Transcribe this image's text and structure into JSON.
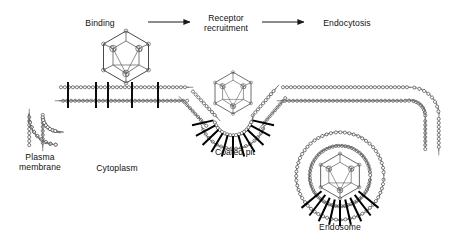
{
  "diagram": {
    "background": "#ffffff",
    "ink": "#1a1a1a",
    "line_color": "#555555",
    "receptor_color": "#000000"
  },
  "flow": {
    "steps": [
      {
        "id": "binding",
        "label": "Binding",
        "x": 100,
        "y": 18
      },
      {
        "id": "recruit",
        "label": "Receptor\nrecruitment",
        "x": 200,
        "y": 13
      },
      {
        "id": "endocyt",
        "label": "Endocytosis",
        "x": 313,
        "y": 18
      }
    ],
    "arrows": [
      {
        "id": "arrow-binding-to-recruitment",
        "x1": 148,
        "y1": 22,
        "x2": 192,
        "y2": 22
      },
      {
        "id": "arrow-recruitment-to-endocytosis",
        "x1": 262,
        "y1": 22,
        "x2": 306,
        "y2": 22
      }
    ]
  },
  "structures": {
    "plasma_membrane": {
      "label": "Plasma\nmembrane",
      "x": 20,
      "y": 152
    },
    "cytoplasm": {
      "label": "Cytoplasm",
      "x": 93,
      "y": 163
    },
    "coated_pit": {
      "label": "Coated pit",
      "x": 211,
      "y": 147
    },
    "endosome": {
      "label": "Endosome",
      "x": 307,
      "y": 222
    }
  },
  "particles": {
    "virus_free": {
      "name": "icosahedral-virus-capsid",
      "cx": 126,
      "cy": 57,
      "r": 25
    },
    "virus_in_pit": {
      "name": "icosahedral-virus-capsid",
      "cx": 233,
      "cy": 93,
      "r": 20
    },
    "virus_in_endosome": {
      "name": "icosahedral-virus-capsid",
      "cx": 340,
      "cy": 176,
      "r": 22
    }
  },
  "membrane": {
    "bilayer_leaflets": 2,
    "head_shape": "lollipop",
    "receptor_shape": "black-bar",
    "receptors_on_flat_membrane": [
      68,
      96,
      108,
      132,
      158
    ]
  }
}
